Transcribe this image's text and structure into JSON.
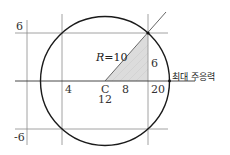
{
  "diagram": {
    "type": "mohr-circle",
    "labels": {
      "tau_top": "6",
      "tau_bottom": "-6",
      "sigma_4": "4",
      "center_letter": "C",
      "center_value": "12",
      "half_base": "8",
      "sigma_20": "20",
      "height": "6",
      "radius": "R=10",
      "radius_italic": "R",
      "radius_value": "=10",
      "max_principal_stress": "최대 주응력"
    },
    "colors": {
      "circle": "#1a1a1a",
      "grid": "#7a7a7a",
      "shade": "#d9d9d9",
      "text": "#333333"
    }
  }
}
